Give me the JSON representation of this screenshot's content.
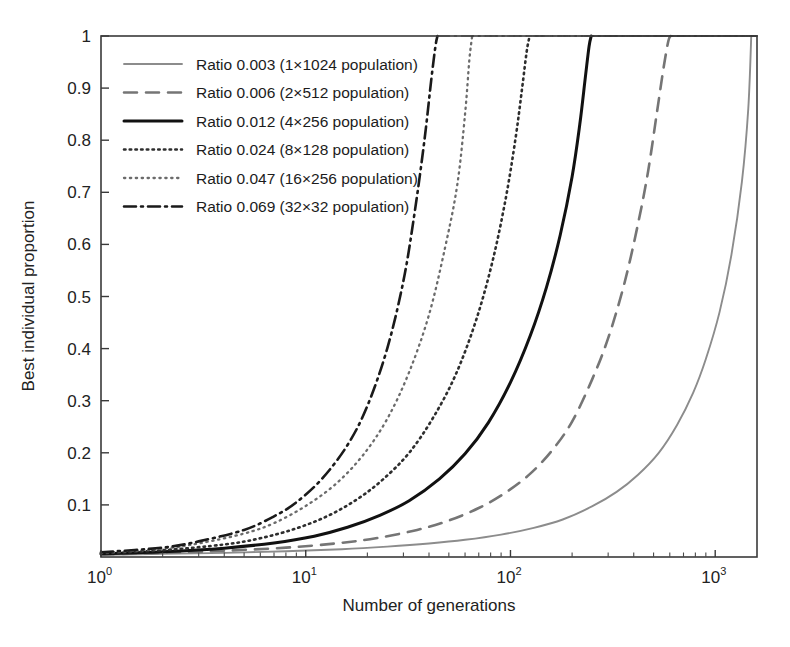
{
  "chart_data": {
    "type": "line",
    "title": "",
    "xlabel": "Number of generations",
    "ylabel": "Best individual proportion",
    "xscale": "log",
    "yscale": "linear",
    "xlim": [
      1,
      1600
    ],
    "ylim": [
      0,
      1
    ],
    "grid": false,
    "legend_position": "upper-left-inside",
    "xticks": [
      {
        "value": 1,
        "label": "10",
        "exponent": "0"
      },
      {
        "value": 10,
        "label": "10",
        "exponent": "1"
      },
      {
        "value": 100,
        "label": "10",
        "exponent": "2"
      },
      {
        "value": 1000,
        "label": "10",
        "exponent": "3"
      }
    ],
    "yticks": [
      "0.1",
      "0.2",
      "0.3",
      "0.4",
      "0.5",
      "0.6",
      "0.7",
      "0.8",
      "0.9",
      "1"
    ],
    "ytick_values": [
      0.1,
      0.2,
      0.3,
      0.4,
      0.5,
      0.6,
      0.7,
      0.8,
      0.9,
      1
    ],
    "series": [
      {
        "name": "Ratio 0.003 (1×1024 population)",
        "ratio": 0.003,
        "population": "1×1024",
        "style": "solid",
        "color": "#8c8c8c",
        "width": 1.9,
        "dash": "",
        "x": [
          1,
          2,
          4,
          8,
          15,
          25,
          40,
          60,
          90,
          130,
          180,
          250,
          330,
          420,
          530,
          650,
          780,
          900,
          1050,
          1200,
          1350,
          1450,
          1500
        ],
        "y": [
          0.004,
          0.006,
          0.008,
          0.011,
          0.015,
          0.02,
          0.026,
          0.033,
          0.043,
          0.056,
          0.072,
          0.097,
          0.125,
          0.158,
          0.2,
          0.253,
          0.315,
          0.38,
          0.47,
          0.58,
          0.72,
          0.86,
          1.0
        ]
      },
      {
        "name": "Ratio 0.006 (2×512 population)",
        "ratio": 0.006,
        "population": "2×512",
        "style": "dashed",
        "color": "#757575",
        "width": 2.6,
        "dash": "13,9",
        "x": [
          1,
          2,
          4,
          8,
          14,
          22,
          35,
          50,
          70,
          95,
          125,
          160,
          200,
          250,
          300,
          360,
          420,
          470,
          520,
          560,
          590,
          605
        ],
        "y": [
          0.005,
          0.008,
          0.012,
          0.018,
          0.026,
          0.036,
          0.052,
          0.07,
          0.094,
          0.124,
          0.16,
          0.205,
          0.26,
          0.34,
          0.42,
          0.525,
          0.64,
          0.74,
          0.855,
          0.94,
          0.99,
          1.0
        ]
      },
      {
        "name": "Ratio 0.012 (4×256 population)",
        "ratio": 0.012,
        "population": "4×256",
        "style": "solid",
        "color": "#111111",
        "width": 3.0,
        "dash": "",
        "x": [
          1,
          2,
          4,
          7,
          11,
          16,
          23,
          32,
          45,
          60,
          78,
          100,
          125,
          150,
          175,
          200,
          218,
          232,
          242,
          248
        ],
        "y": [
          0.006,
          0.01,
          0.017,
          0.027,
          0.04,
          0.057,
          0.08,
          0.108,
          0.15,
          0.198,
          0.258,
          0.335,
          0.425,
          0.518,
          0.618,
          0.73,
          0.83,
          0.92,
          0.98,
          1.0
        ]
      },
      {
        "name": "Ratio 0.024 (8×128 population)",
        "ratio": 0.024,
        "population": "8×128",
        "style": "dotted",
        "color": "#2e2e2e",
        "width": 2.6,
        "dash": "1.5,4.2",
        "x": [
          1,
          2,
          4,
          6,
          9,
          13,
          18,
          24,
          32,
          42,
          54,
          68,
          82,
          95,
          106,
          114,
          120,
          124
        ],
        "y": [
          0.007,
          0.013,
          0.024,
          0.036,
          0.055,
          0.08,
          0.112,
          0.15,
          0.2,
          0.268,
          0.35,
          0.455,
          0.57,
          0.69,
          0.805,
          0.9,
          0.97,
          1.0
        ]
      },
      {
        "name": "Ratio 0.047 (16×256 population)",
        "ratio": 0.047,
        "population": "16×256",
        "style": "dotted",
        "color": "#6b6b6b",
        "width": 2.3,
        "dash": "1.3,4.6",
        "x": [
          1,
          2,
          3,
          5,
          7,
          10,
          14,
          19,
          25,
          32,
          40,
          48,
          55,
          60,
          63,
          65
        ],
        "y": [
          0.008,
          0.016,
          0.026,
          0.045,
          0.065,
          0.098,
          0.14,
          0.195,
          0.265,
          0.355,
          0.465,
          0.595,
          0.715,
          0.85,
          0.955,
          1.0
        ]
      },
      {
        "name": "Ratio 0.069 (32×32 population)",
        "ratio": 0.069,
        "population": "32×32",
        "style": "dashdot",
        "color": "#1a1a1a",
        "width": 2.6,
        "dash": "12,5,2,5",
        "x": [
          1,
          2,
          3,
          5,
          7,
          9,
          12,
          16,
          20,
          25,
          30,
          34,
          38,
          41,
          43,
          44
        ],
        "y": [
          0.009,
          0.018,
          0.03,
          0.052,
          0.078,
          0.105,
          0.15,
          0.215,
          0.29,
          0.4,
          0.53,
          0.66,
          0.8,
          0.915,
          0.98,
          1.0
        ]
      }
    ]
  },
  "legend": {
    "entries": [
      "Ratio 0.003 (1×1024 population)",
      "Ratio 0.006 (2×512 population)",
      "Ratio 0.012 (4×256 population)",
      "Ratio 0.024 (8×128 population)",
      "Ratio 0.047 (16×256 population)",
      "Ratio 0.069 (32×32 population)"
    ]
  },
  "colors": {
    "axis": "#3a3a3a",
    "text": "#1c1c1c",
    "background": "#ffffff"
  }
}
